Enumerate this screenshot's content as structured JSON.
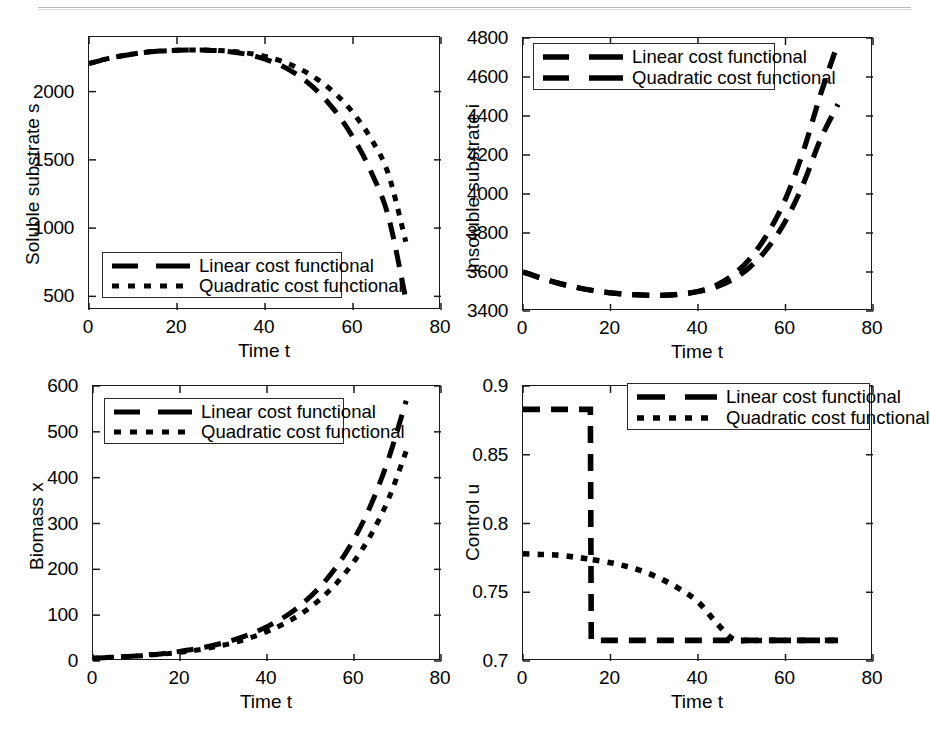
{
  "figure": {
    "layout": "2x2 subplot grid",
    "series_names": [
      "Linear cost functional",
      "Quadratic cost functional"
    ],
    "line_color": "#000000",
    "axis_color": "#1a1a1a",
    "background": "#ffffff"
  },
  "legend": {
    "linear_label": "Linear cost functional",
    "quadratic_label": "Quadratic cost functional"
  },
  "chart_data": [
    {
      "panel": "soluble-substrate",
      "type": "line",
      "title": "",
      "xlabel": "Time t",
      "ylabel": "Soluble substrate s",
      "xlim": [
        0,
        80
      ],
      "ylim": [
        400,
        2400
      ],
      "xticks": [
        0,
        20,
        40,
        60,
        80
      ],
      "yticks": [
        500,
        1000,
        1500,
        2000
      ],
      "grid": false,
      "legend_position": "lower-left",
      "x": [
        0,
        4,
        8,
        12,
        16,
        20,
        24,
        28,
        32,
        36,
        40,
        44,
        48,
        52,
        56,
        60,
        64,
        68,
        72
      ],
      "series": [
        {
          "name": "Linear cost functional",
          "style": "dashed",
          "values": [
            2205,
            2240,
            2265,
            2285,
            2297,
            2303,
            2305,
            2302,
            2292,
            2272,
            2238,
            2185,
            2108,
            2000,
            1855,
            1665,
            1420,
            1090,
            480
          ]
        },
        {
          "name": "Quadratic cost functional",
          "style": "dotted",
          "values": [
            2205,
            2240,
            2265,
            2285,
            2297,
            2303,
            2305,
            2303,
            2296,
            2282,
            2258,
            2220,
            2165,
            2088,
            1985,
            1845,
            1660,
            1400,
            900
          ]
        }
      ]
    },
    {
      "panel": "insoluble-substrate",
      "type": "line",
      "title": "",
      "xlabel": "Time t",
      "ylabel": "Insoluble substrate i",
      "xlim": [
        0,
        80
      ],
      "ylim": [
        3400,
        4800
      ],
      "xticks": [
        0,
        20,
        40,
        60,
        80
      ],
      "yticks": [
        3400,
        3600,
        3800,
        4000,
        4200,
        4400,
        4600,
        4800
      ],
      "grid": false,
      "legend_position": "upper-left",
      "x": [
        0,
        4,
        8,
        12,
        16,
        20,
        24,
        28,
        32,
        36,
        40,
        44,
        48,
        52,
        56,
        60,
        64,
        68,
        72
      ],
      "series": [
        {
          "name": "Linear cost functional",
          "style": "dashed",
          "values": [
            3600,
            3570,
            3543,
            3522,
            3505,
            3493,
            3485,
            3481,
            3480,
            3486,
            3500,
            3530,
            3585,
            3672,
            3800,
            3975,
            4215,
            4510,
            4775
          ]
        },
        {
          "name": "Quadratic cost functional",
          "style": "dashed",
          "values": [
            3600,
            3570,
            3543,
            3522,
            3505,
            3493,
            3485,
            3481,
            3481,
            3487,
            3500,
            3522,
            3562,
            3628,
            3725,
            3862,
            4048,
            4280,
            4460
          ]
        }
      ]
    },
    {
      "panel": "biomass",
      "type": "line",
      "title": "",
      "xlabel": "Time t",
      "ylabel": "Biomass x",
      "xlim": [
        0,
        80
      ],
      "ylim": [
        0,
        600
      ],
      "xticks": [
        0,
        20,
        40,
        60,
        80
      ],
      "yticks": [
        0,
        100,
        200,
        300,
        400,
        500,
        600
      ],
      "grid": false,
      "legend_position": "upper-left",
      "x": [
        0,
        4,
        8,
        12,
        16,
        20,
        24,
        28,
        32,
        36,
        40,
        44,
        48,
        52,
        56,
        60,
        64,
        68,
        72
      ],
      "series": [
        {
          "name": "Linear cost functional",
          "style": "dashed",
          "values": [
            6,
            8,
            10,
            13,
            16,
            21,
            27,
            35,
            45,
            58,
            75,
            96,
            124,
            160,
            206,
            266,
            343,
            443,
            568
          ]
        },
        {
          "name": "Quadratic cost functional",
          "style": "dotted",
          "values": [
            6,
            8,
            10,
            12,
            15,
            19,
            24,
            31,
            39,
            50,
            64,
            82,
            104,
            133,
            170,
            217,
            277,
            355,
            458
          ]
        }
      ]
    },
    {
      "panel": "control",
      "type": "line",
      "title": "",
      "xlabel": "Time t",
      "ylabel": "Control u",
      "xlim": [
        0,
        80
      ],
      "ylim": [
        0.7,
        0.9
      ],
      "xticks": [
        0,
        20,
        40,
        60,
        80
      ],
      "yticks": [
        0.7,
        0.75,
        0.8,
        0.85,
        0.9
      ],
      "grid": false,
      "legend_position": "upper-right",
      "switch_time": 15.5,
      "x": [
        0,
        4,
        8,
        12,
        15.4,
        15.6,
        20,
        24,
        28,
        32,
        36,
        40,
        44,
        48,
        52,
        56,
        60,
        64,
        68,
        72
      ],
      "series": [
        {
          "name": "Linear cost functional",
          "style": "dashed",
          "values": [
            0.883,
            0.883,
            0.883,
            0.883,
            0.883,
            0.715,
            0.715,
            0.715,
            0.715,
            0.715,
            0.715,
            0.715,
            0.715,
            0.715,
            0.715,
            0.715,
            0.715,
            0.715,
            0.715,
            0.715
          ]
        },
        {
          "name": "Quadratic cost functional",
          "style": "dotted",
          "values": [
            0.778,
            0.7775,
            0.777,
            0.7755,
            0.774,
            0.7738,
            0.7715,
            0.7685,
            0.7645,
            0.759,
            0.752,
            0.743,
            0.7285,
            0.716,
            0.715,
            0.715,
            0.715,
            0.715,
            0.715,
            0.715
          ]
        }
      ]
    }
  ]
}
